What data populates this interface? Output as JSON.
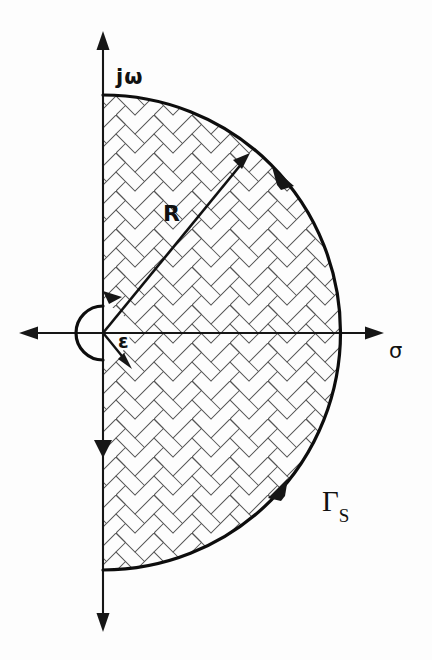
{
  "figure": {
    "kind": "complex-plane-nyquist-contour",
    "background_color": "#fdfdfd",
    "ink_color": "#111111",
    "hatch_color": "#3a3a3a",
    "labels": {
      "imaginary_axis": "jω",
      "real_axis": "σ",
      "large_radius": "R",
      "small_radius": "ε",
      "contour_name": "Γ",
      "contour_subscript": "S"
    },
    "geometry": {
      "origin": {
        "x": 103,
        "y": 333
      },
      "large_arc_radius": 228,
      "large_arc_top": {
        "x": 103,
        "y": 95
      },
      "large_arc_bottom": {
        "x": 103,
        "y": 570
      },
      "large_arc_right": {
        "x": 331,
        "y": 333
      },
      "small_arc_radius": 27,
      "vertical_axis_top": {
        "x": 103,
        "y": 34
      },
      "vertical_axis_bottom": {
        "x": 103,
        "y": 629
      },
      "horizontal_axis_left": {
        "x": 20,
        "y": 333
      },
      "horizontal_axis_right": {
        "x": 384,
        "y": 333
      },
      "radius_arrow_tip": {
        "x": 248,
        "y": 157
      },
      "epsilon_arrow_tip": {
        "x": 130,
        "y": 366
      }
    },
    "direction_markers": [
      {
        "name": "upper-arc-arrowhead",
        "x": 280,
        "y": 177,
        "direction": "counterclockwise-up"
      },
      {
        "name": "lower-arc-arrowhead",
        "x": 280,
        "y": 489,
        "direction": "counterclockwise-up"
      },
      {
        "name": "imaginary-axis-arrowhead",
        "x": 103,
        "y": 451,
        "direction": "down"
      },
      {
        "name": "epsilon-top-arrowhead",
        "x": 113,
        "y": 292,
        "direction": "right"
      }
    ]
  }
}
